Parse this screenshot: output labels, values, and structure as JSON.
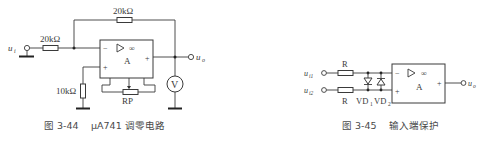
{
  "figures": [
    {
      "id": "fig-3-44",
      "caption_number": "图 3-44",
      "caption_title": "μA741 调零电路",
      "labels": {
        "input": "u",
        "input_sub": "i",
        "output": "u",
        "output_sub": "o",
        "r_in": "20kΩ",
        "r_feedback": "20kΩ",
        "r_ground": "10kΩ",
        "pot": "RP",
        "opamp": "A",
        "opamp_gain": "∞",
        "minus": "−",
        "plus": "+",
        "out_plus": "+",
        "meter": "V"
      }
    },
    {
      "id": "fig-3-45",
      "caption_number": "图 3-45",
      "caption_title": "输入端保护",
      "labels": {
        "input1": "u",
        "input1_sub": "i1",
        "input2": "u",
        "input2_sub": "i2",
        "output": "u",
        "output_sub": "o",
        "r1": "R",
        "r2": "R",
        "vd1": "VD",
        "vd1_sub": "1",
        "vd2": "VD",
        "vd2_sub": "2",
        "opamp": "A",
        "opamp_gain": "∞",
        "minus": "−",
        "plus": "+",
        "out_plus": "+"
      }
    }
  ]
}
